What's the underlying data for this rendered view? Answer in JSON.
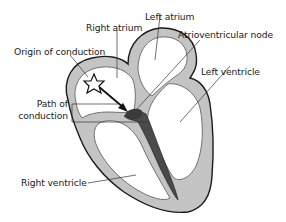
{
  "diagram": {
    "labels": {
      "left_atrium": "Left atrium",
      "right_atrium": "Right atrium",
      "av_node": "Atrioventricular node",
      "origin": "Origin of conduction",
      "left_ventricle": "Left ventricle",
      "path_line1": "Path of",
      "path_line2": "conduction",
      "right_ventricle": "Right ventricle"
    },
    "colors": {
      "wall_fill": "#c4c4c4",
      "wall_outline": "#1a1a1a",
      "chamber_fill": "#ffffff",
      "conduction_fill": "#4a4a4a",
      "leader_line": "#333333",
      "text": "#222222"
    }
  }
}
